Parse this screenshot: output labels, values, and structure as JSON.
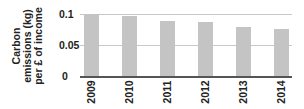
{
  "chart_data": {
    "type": "bar",
    "title": "",
    "xlabel": "",
    "ylabel": "Carbon emissions (kg) per £ of income",
    "ylabel_lines": [
      "Carbon",
      "emissions (kg)",
      "per £ of income"
    ],
    "categories": [
      "2009",
      "2010",
      "2011",
      "2012",
      "2013",
      "2014"
    ],
    "values": [
      0.1,
      0.096,
      0.089,
      0.087,
      0.079,
      0.075
    ],
    "ylim": [
      0,
      0.1
    ],
    "yticks": [
      "0",
      "0.05",
      "0.1"
    ],
    "grid": true,
    "legend": null,
    "bar_color": "#c4c4c4"
  }
}
